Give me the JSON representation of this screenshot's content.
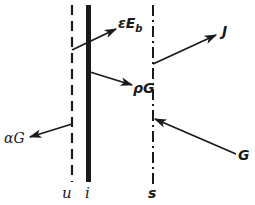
{
  "diagram": {
    "type": "surface energy balance schematic",
    "colors": {
      "ink": "#1a1a1a",
      "background": "#ffffff"
    },
    "surfaces": [
      {
        "id": "u",
        "label": "u",
        "style": "dashed",
        "x": 72
      },
      {
        "id": "i",
        "label": "i",
        "style": "thick-solid",
        "x": 88
      },
      {
        "id": "s",
        "label": "s",
        "style": "dash-dot",
        "x": 153
      }
    ],
    "arrows": [
      {
        "id": "emitted",
        "label_main": "εE",
        "label_sub": "b",
        "from_surface": "u",
        "direction": "up-right"
      },
      {
        "id": "reflected-inner",
        "label": "ρG",
        "from_surface": "i",
        "direction": "down-right"
      },
      {
        "id": "absorbed",
        "label": "αG",
        "from_surface": "u",
        "direction": "down-left"
      },
      {
        "id": "radiosity",
        "label": "J",
        "from_surface": "s",
        "direction": "up-right"
      },
      {
        "id": "irradiation",
        "label": "G",
        "to_surface": "s",
        "direction": "up-left"
      }
    ]
  }
}
